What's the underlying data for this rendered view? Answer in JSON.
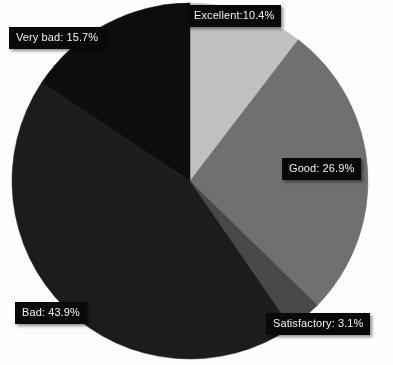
{
  "chart_data": {
    "type": "pie",
    "title": "",
    "subtitle": "",
    "xlabel": "",
    "ylabel": "",
    "legend_position": "none",
    "grid": false,
    "labels_on_slices": true,
    "start_angle_deg": 0,
    "direction": "clockwise",
    "categories": [
      "Excellent",
      "Good",
      "Satisfactory",
      "Bad",
      "Very bad"
    ],
    "values": [
      10.4,
      26.9,
      3.1,
      43.9,
      15.7
    ],
    "value_unit": "%",
    "annotations": [
      "Excellent:10.4%",
      "Good: 26.9%",
      "Satisfactory: 3.1%",
      "Bad: 43.9%",
      "Very bad: 15.7%"
    ],
    "slices": [
      {
        "name": "Excellent",
        "value": 10.4,
        "label": "Excellent:10.4%",
        "color": "#c2c2c2"
      },
      {
        "name": "Good",
        "value": 26.9,
        "label": "Good: 26.9%",
        "color": "#6f6f6f"
      },
      {
        "name": "Satisfactory",
        "value": 3.1,
        "label": "Satisfactory: 3.1%",
        "color": "#4a4a4a"
      },
      {
        "name": "Bad",
        "value": 43.9,
        "label": "Bad: 43.9%",
        "color": "#1d1d1d"
      },
      {
        "name": "Very bad",
        "value": 15.7,
        "label": "Very bad: 15.7%",
        "color": "#0a0a0a"
      }
    ]
  },
  "labels": {
    "excellent": "Excellent:10.4%",
    "good": "Good: 26.9%",
    "satisfactory": "Satisfactory: 3.1%",
    "bad": "Bad: 43.9%",
    "very_bad": "Very bad: 15.7%"
  },
  "colors": {
    "background": "#ffffff",
    "label_box": "#090909",
    "label_text": "#f2f2f2",
    "excellent": "#c2c2c2",
    "good": "#6f6f6f",
    "satisfactory": "#4a4a4a",
    "bad": "#1d1d1d",
    "very_bad": "#0a0a0a"
  },
  "geometry": {
    "center_x": 190,
    "center_y": 181,
    "radius": 178
  }
}
